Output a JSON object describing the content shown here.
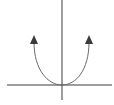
{
  "diagram": {
    "type": "parabola-graph",
    "colors": {
      "background": "#ffffff",
      "axis": "#3a3a3a",
      "curve": "#6a6a6a",
      "arrowhead": "#3a3a3a"
    },
    "axes": {
      "x_axis": {
        "x1": 7,
        "y1": 85,
        "x2": 112,
        "y2": 85
      },
      "y_axis": {
        "x1": 62,
        "y1": 0,
        "x2": 62,
        "y2": 100
      }
    },
    "curve": {
      "vertex": {
        "x": 62,
        "y": 85
      },
      "left_end": {
        "x": 34,
        "y": 42
      },
      "right_end": {
        "x": 89,
        "y": 42
      },
      "path": "M34,42 C34,70 48,85 62,85 C76,85 89,70 89,42"
    },
    "arrows": [
      {
        "name": "left-arrowhead",
        "points": "34,35 30,44 38,44"
      },
      {
        "name": "right-arrowhead",
        "points": "89,35 85,44 93,44"
      }
    ]
  }
}
